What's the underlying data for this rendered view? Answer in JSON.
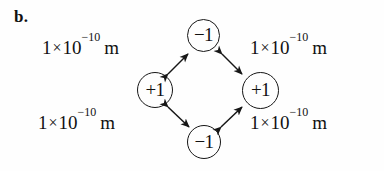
{
  "figure": {
    "part_label": "b.",
    "background_color": "#fefefe",
    "ink_color": "#111111"
  },
  "charges": [
    {
      "id": "top",
      "label": "−1",
      "sign": "negative",
      "position": "top"
    },
    {
      "id": "left",
      "label": "+1",
      "sign": "positive",
      "position": "left"
    },
    {
      "id": "right",
      "label": "+1",
      "sign": "positive",
      "position": "right"
    },
    {
      "id": "bottom",
      "label": "−1",
      "sign": "negative",
      "position": "bottom"
    }
  ],
  "distances": [
    {
      "id": "top-left",
      "mantissa": "1",
      "times": "×",
      "base": "10",
      "exponent": "−10",
      "unit": "m",
      "full_text": "1 × 10⁻¹⁰ m"
    },
    {
      "id": "top-right",
      "mantissa": "1",
      "times": "×",
      "base": "10",
      "exponent": "−10",
      "unit": "m",
      "full_text": "1 × 10⁻¹⁰ m"
    },
    {
      "id": "bottom-left",
      "mantissa": "1",
      "times": "×",
      "base": "10",
      "exponent": "−10",
      "unit": "m",
      "full_text": "1 × 10⁻¹⁰ m"
    },
    {
      "id": "bottom-right",
      "mantissa": "1",
      "times": "×",
      "base": "10",
      "exponent": "−10",
      "unit": "m",
      "full_text": "1 × 10⁻¹⁰ m"
    }
  ],
  "arrows": [
    {
      "id": "left-to-top",
      "style": "double-headed",
      "from": "left",
      "to": "top"
    },
    {
      "id": "top-to-right",
      "style": "double-headed",
      "from": "top",
      "to": "right"
    },
    {
      "id": "left-to-bottom",
      "style": "double-headed",
      "from": "left",
      "to": "bottom"
    },
    {
      "id": "bottom-to-right",
      "style": "double-headed",
      "from": "bottom",
      "to": "right"
    }
  ]
}
